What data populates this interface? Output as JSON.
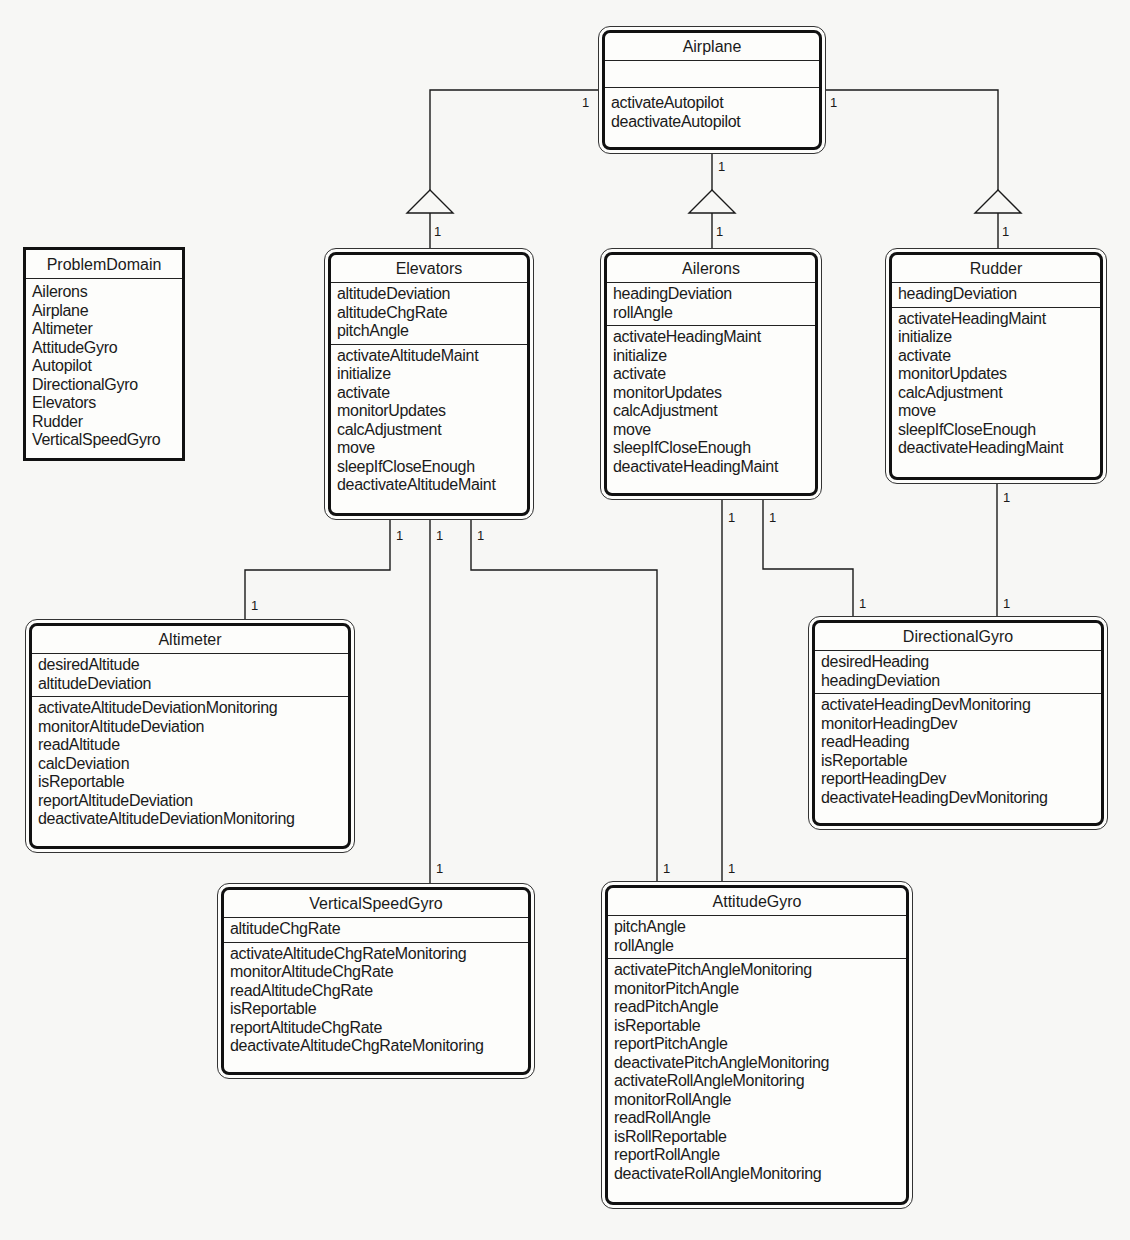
{
  "diagram": {
    "type": "UML class diagram",
    "problem_domain": {
      "title": "ProblemDomain",
      "items": [
        "Ailerons",
        "Airplane",
        "Altimeter",
        "AttitudeGyro",
        "Autopilot",
        "DirectionalGyro",
        "Elevators",
        "Rudder",
        "VerticalSpeedGyro"
      ]
    },
    "classes": {
      "airplane": {
        "name": "Airplane",
        "attributes": [],
        "operations": [
          "activateAutopilot",
          "deactivateAutopilot"
        ]
      },
      "elevators": {
        "name": "Elevators",
        "attributes": [
          "altitudeDeviation",
          "altitudeChgRate",
          "pitchAngle"
        ],
        "operations": [
          "activateAltitudeMaint",
          "initialize",
          "activate",
          "monitorUpdates",
          "calcAdjustment",
          "move",
          "sleepIfCloseEnough",
          "deactivateAltitudeMaint"
        ]
      },
      "ailerons": {
        "name": "Ailerons",
        "attributes": [
          "headingDeviation",
          "rollAngle"
        ],
        "operations": [
          "activateHeadingMaint",
          "initialize",
          "activate",
          "monitorUpdates",
          "calcAdjustment",
          "move",
          "sleepIfCloseEnough",
          "deactivateHeadingMaint"
        ]
      },
      "rudder": {
        "name": "Rudder",
        "attributes": [
          "headingDeviation"
        ],
        "operations": [
          "activateHeadingMaint",
          "initialize",
          "activate",
          "monitorUpdates",
          "calcAdjustment",
          "move",
          "sleepIfCloseEnough",
          "deactivateHeadingMaint"
        ]
      },
      "altimeter": {
        "name": "Altimeter",
        "attributes": [
          "desiredAltitude",
          "altitudeDeviation"
        ],
        "operations": [
          "activateAltitudeDeviationMonitoring",
          "monitorAltitudeDeviation",
          "readAltitude",
          "calcDeviation",
          "isReportable",
          "reportAltitudeDeviation",
          "deactivateAltitudeDeviationMonitoring"
        ]
      },
      "directional_gyro": {
        "name": "DirectionalGyro",
        "attributes": [
          "desiredHeading",
          "headingDeviation"
        ],
        "operations": [
          "activateHeadingDevMonitoring",
          "monitorHeadingDev",
          "readHeading",
          "isReportable",
          "reportHeadingDev",
          "deactivateHeadingDevMonitoring"
        ]
      },
      "vertical_speed_gyro": {
        "name": "VerticalSpeedGyro",
        "attributes": [
          "altitudeChgRate"
        ],
        "operations": [
          "activateAltitudeChgRateMonitoring",
          "monitorAltitudeChgRate",
          "readAltitudeChgRate",
          "isReportable",
          "reportAltitudeChgRate",
          "deactivateAltitudeChgRateMonitoring"
        ]
      },
      "attitude_gyro": {
        "name": "AttitudeGyro",
        "attributes": [
          "pitchAngle",
          "rollAngle"
        ],
        "operations": [
          "activatePitchAngleMonitoring",
          "monitorPitchAngle",
          "readPitchAngle",
          "isReportable",
          "reportPitchAngle",
          "deactivatePitchAngleMonitoring",
          "activateRollAngleMonitoring",
          "monitorRollAngle",
          "readRollAngle",
          "isRollReportable",
          "reportRollAngle",
          "deactivateRollAngleMonitoring"
        ]
      }
    },
    "relationships": [
      {
        "from": "Airplane",
        "to": "Elevators",
        "kind": "aggregation",
        "from_mult": "1",
        "to_mult": "1"
      },
      {
        "from": "Airplane",
        "to": "Ailerons",
        "kind": "aggregation",
        "from_mult": "1",
        "to_mult": "1"
      },
      {
        "from": "Airplane",
        "to": "Rudder",
        "kind": "aggregation",
        "from_mult": "1",
        "to_mult": "1"
      },
      {
        "from": "Elevators",
        "to": "Altimeter",
        "kind": "association",
        "from_mult": "1",
        "to_mult": "1"
      },
      {
        "from": "Elevators",
        "to": "VerticalSpeedGyro",
        "kind": "association",
        "from_mult": "1",
        "to_mult": "1"
      },
      {
        "from": "Elevators",
        "to": "AttitudeGyro",
        "kind": "association",
        "from_mult": "1",
        "to_mult": "1"
      },
      {
        "from": "Ailerons",
        "to": "AttitudeGyro",
        "kind": "association",
        "from_mult": "1",
        "to_mult": "1"
      },
      {
        "from": "Ailerons",
        "to": "DirectionalGyro",
        "kind": "association",
        "from_mult": "1",
        "to_mult": "1"
      },
      {
        "from": "Rudder",
        "to": "DirectionalGyro",
        "kind": "association",
        "from_mult": "1",
        "to_mult": "1"
      }
    ],
    "multiplicity_label": "1",
    "colors": {
      "line": "#1a1a1a",
      "background": "#f7f7f5",
      "box_fill": "#fdfdfb"
    }
  }
}
